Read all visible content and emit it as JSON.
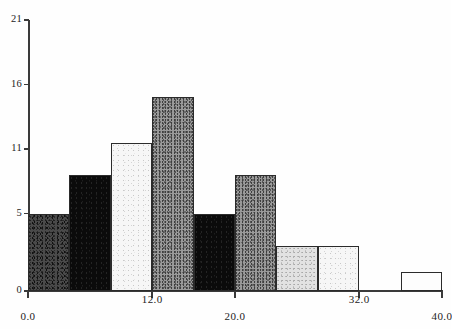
{
  "chart_data": {
    "type": "bar",
    "title": "",
    "subtitle": "",
    "xlabel": "",
    "ylabel": "",
    "grid": false,
    "legend": false,
    "legend_position": "none",
    "xlim": [
      0.0,
      40.0
    ],
    "ylim": [
      0,
      21
    ],
    "bin_width": 4.0,
    "x_tick_labels": [
      "0.0",
      "12.0",
      "20.0",
      "32.0",
      "40.0"
    ],
    "x_tick_values": [
      0.0,
      12.0,
      20.0,
      32.0,
      40.0
    ],
    "y_tick_labels": [
      "0",
      "5",
      "11",
      "16",
      "21"
    ],
    "y_tick_values": [
      0,
      6,
      11,
      16,
      21
    ],
    "categories": [
      "0-4",
      "4-8",
      "8-12",
      "12-16",
      "16-20",
      "20-24",
      "24-28",
      "28-32",
      "32-36",
      "36-40"
    ],
    "bin_starts": [
      0,
      4,
      8,
      12,
      16,
      20,
      24,
      28,
      32,
      36
    ],
    "bin_ends": [
      4,
      8,
      12,
      16,
      20,
      24,
      28,
      32,
      36,
      40
    ],
    "values": [
      6,
      9,
      11.5,
      15,
      6,
      9,
      3.5,
      3.5,
      0,
      1.5
    ],
    "fills": [
      "darkgray",
      "black",
      "verylight",
      "midgray",
      "black",
      "midgray",
      "lightgray",
      "verylight",
      "none",
      "white"
    ],
    "colors": {
      "darkgray": "#4a4a4a",
      "black": "#0b0b0b",
      "verylight": "#f6f6f6",
      "midgray": "#9a9a9a",
      "lightgray": "#e2e2e2",
      "white": "#fdfdfd",
      "axis": "#3a3a3a",
      "outline": "#2b2b2b",
      "background": "#ffffff"
    }
  }
}
